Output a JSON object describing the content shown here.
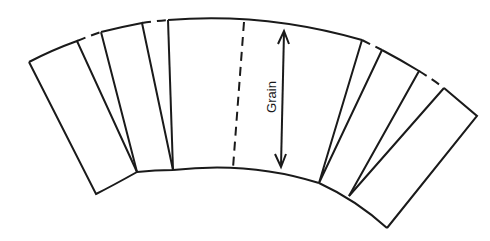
{
  "diagram": {
    "type": "pattern-piece-slash-and-spread",
    "grain_label": "Grain",
    "stroke_color": "#1a1a1a",
    "background_color": "#ffffff",
    "pieces": [
      {
        "name": "left-outer-panel"
      },
      {
        "name": "left-inner-panel"
      },
      {
        "name": "center-panel"
      },
      {
        "name": "right-inner-panel"
      },
      {
        "name": "right-outer-panel"
      }
    ],
    "annotations": [
      {
        "type": "grainline-arrow",
        "label": "Grain",
        "orientation": "vertical"
      },
      {
        "type": "center-fold-dashed-line"
      },
      {
        "type": "dashed-gap-connectors",
        "count": 4
      }
    ]
  }
}
